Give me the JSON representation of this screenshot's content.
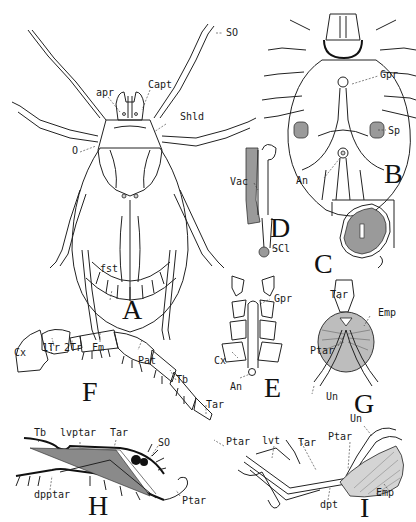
{
  "plate": {
    "subject": "Tick anatomy illustration plate",
    "panels": [
      {
        "id": "A",
        "letter": "A",
        "labels": [
          "SO",
          "apr",
          "Capt",
          "Shld",
          "O",
          "fst"
        ]
      },
      {
        "id": "B",
        "letter": "B",
        "labels": [
          "Gpr",
          "Sp",
          "An"
        ]
      },
      {
        "id": "C",
        "letter": "C",
        "labels": []
      },
      {
        "id": "D",
        "letter": "D",
        "labels": [
          "Vac",
          "SCl"
        ]
      },
      {
        "id": "E",
        "letter": "E",
        "labels": [
          "Gpr",
          "Cx",
          "An"
        ]
      },
      {
        "id": "F",
        "letter": "F",
        "labels": [
          "Cx",
          "1Tr",
          "2Tr",
          "Fm",
          "Pat",
          "Tb",
          "Tar",
          "Ptar"
        ]
      },
      {
        "id": "G",
        "letter": "G",
        "labels": [
          "Tar",
          "Emp",
          "Ptar",
          "Un"
        ]
      },
      {
        "id": "H",
        "letter": "H",
        "labels": [
          "Tb",
          "lvptar",
          "Tar",
          "SO",
          "dpptar",
          "Ptar"
        ]
      },
      {
        "id": "I",
        "letter": "I",
        "labels": [
          "Un",
          "lvt",
          "Tar",
          "Ptar",
          "Emp",
          "dpt"
        ]
      }
    ]
  },
  "A": {
    "letter": "A",
    "so": "SO",
    "apr": "apr",
    "capt": "Capt",
    "shld": "Shld",
    "o": "O",
    "fst": "fst"
  },
  "B": {
    "letter": "B",
    "gpr": "Gpr",
    "sp": "Sp",
    "an": "An"
  },
  "C": {
    "letter": "C"
  },
  "D": {
    "letter": "D",
    "vac": "Vac",
    "scl": "SCl"
  },
  "E": {
    "letter": "E",
    "gpr": "Gpr",
    "cx": "Cx",
    "an": "An"
  },
  "F": {
    "letter": "F",
    "cx": "Cx",
    "tr1": "1Tr",
    "tr2": "2Tr",
    "fm": "Fm",
    "pat": "Pat",
    "tb": "Tb",
    "tar": "Tar",
    "ptar": "Ptar"
  },
  "G": {
    "letter": "G",
    "tar": "Tar",
    "emp": "Emp",
    "ptar": "Ptar",
    "un": "Un"
  },
  "H": {
    "letter": "H",
    "tb": "Tb",
    "lvptar": "lvptar",
    "tar": "Tar",
    "so": "SO",
    "dpptar": "dpptar",
    "ptar": "Ptar"
  },
  "I": {
    "letter": "I",
    "un": "Un",
    "lvt": "lvt",
    "tar": "Tar",
    "ptar": "Ptar",
    "emp": "Emp",
    "dpt": "dpt"
  },
  "colors": {
    "ink": "#1a1a1a",
    "background": "#ffffff",
    "stipple": "#9a9a9a"
  }
}
